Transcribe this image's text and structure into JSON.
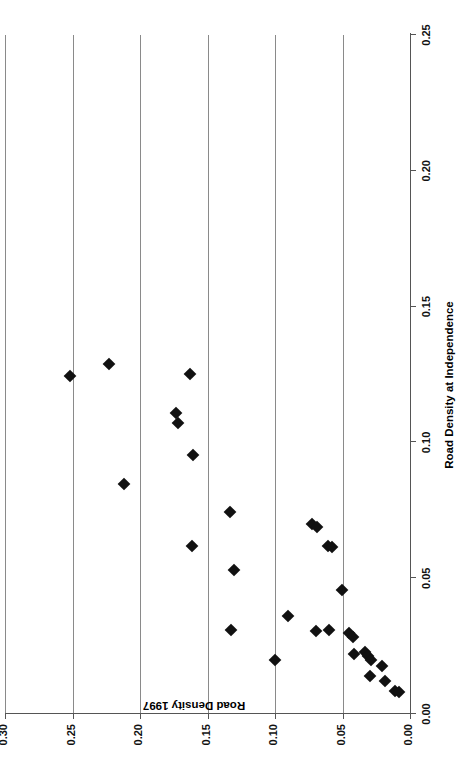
{
  "figure": {
    "background": "#ffffff",
    "marker_color": "#111111",
    "grid_color": "#8a8a8a",
    "axis_color": "#555555",
    "orientation_note": "rotated-90-ccw"
  },
  "chart_data": {
    "type": "scatter",
    "title": "",
    "xlabel": "Road Density at Independence",
    "ylabel": "Road Density 1997",
    "xlim": [
      0.0,
      0.25
    ],
    "ylim": [
      0.0,
      0.3
    ],
    "xticks": [
      0.0,
      0.05,
      0.1,
      0.15,
      0.2,
      0.25
    ],
    "xticklabels": [
      "0.00",
      "0.05",
      "0.10",
      "0.15",
      "0.20",
      "0.25"
    ],
    "yticks": [
      0.0,
      0.05,
      0.1,
      0.15,
      0.2,
      0.25,
      0.3
    ],
    "yticklabels": [
      "0.00",
      "0.05",
      "0.10",
      "0.15",
      "0.20",
      "0.25",
      "0.30"
    ],
    "grid": "y-major-only",
    "legend": null,
    "marker": "diamond",
    "points": [
      {
        "x": 0.1245,
        "y": 0.2515
      },
      {
        "x": 0.129,
        "y": 0.223
      },
      {
        "x": 0.0845,
        "y": 0.212
      },
      {
        "x": 0.125,
        "y": 0.163
      },
      {
        "x": 0.111,
        "y": 0.173
      },
      {
        "x": 0.107,
        "y": 0.1715
      },
      {
        "x": 0.0955,
        "y": 0.161
      },
      {
        "x": 0.062,
        "y": 0.1615
      },
      {
        "x": 0.0745,
        "y": 0.1335
      },
      {
        "x": 0.053,
        "y": 0.1305
      },
      {
        "x": 0.031,
        "y": 0.1325
      },
      {
        "x": 0.02,
        "y": 0.1
      },
      {
        "x": 0.036,
        "y": 0.0905
      },
      {
        "x": 0.07,
        "y": 0.0725
      },
      {
        "x": 0.069,
        "y": 0.069
      },
      {
        "x": 0.062,
        "y": 0.0605
      },
      {
        "x": 0.0615,
        "y": 0.058
      },
      {
        "x": 0.0305,
        "y": 0.07
      },
      {
        "x": 0.0455,
        "y": 0.0505
      },
      {
        "x": 0.031,
        "y": 0.06
      },
      {
        "x": 0.03,
        "y": 0.0455
      },
      {
        "x": 0.0285,
        "y": 0.042
      },
      {
        "x": 0.022,
        "y": 0.0415
      },
      {
        "x": 0.023,
        "y": 0.033
      },
      {
        "x": 0.0215,
        "y": 0.031
      },
      {
        "x": 0.02,
        "y": 0.029
      },
      {
        "x": 0.0175,
        "y": 0.0205
      },
      {
        "x": 0.014,
        "y": 0.03
      },
      {
        "x": 0.012,
        "y": 0.0185
      },
      {
        "x": 0.0085,
        "y": 0.011
      },
      {
        "x": 0.008,
        "y": 0.0085
      }
    ]
  }
}
